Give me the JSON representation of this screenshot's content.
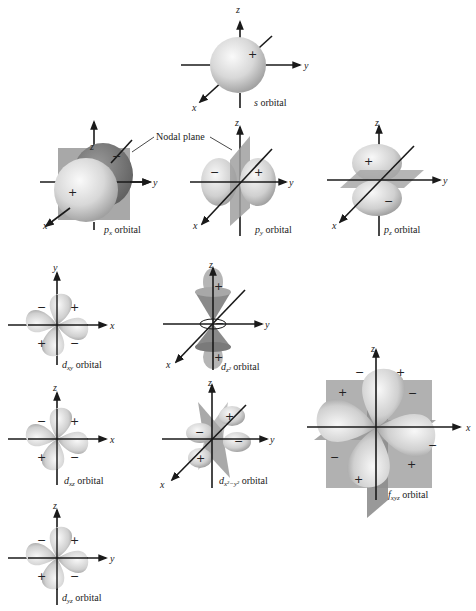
{
  "diagram": {
    "nodal_plane_label": "Nodal plane",
    "orbitals": [
      {
        "id": "s",
        "symbol": "s",
        "subscript": "",
        "suffix": "orbital",
        "axes": [
          "x",
          "y",
          "z"
        ],
        "signs": [
          "+"
        ]
      },
      {
        "id": "px",
        "symbol": "p",
        "subscript": "x",
        "suffix": "orbital",
        "axes": [
          "x",
          "y",
          "z"
        ],
        "signs": [
          "+",
          "−"
        ]
      },
      {
        "id": "py",
        "symbol": "p",
        "subscript": "y",
        "suffix": "orbital",
        "axes": [
          "x",
          "y",
          "z"
        ],
        "signs": [
          "−",
          "+"
        ]
      },
      {
        "id": "pz",
        "symbol": "p",
        "subscript": "z",
        "suffix": "orbital",
        "axes": [
          "x",
          "y",
          "z"
        ],
        "signs": [
          "+",
          "−"
        ]
      },
      {
        "id": "dxy",
        "symbol": "d",
        "subscript": "xy",
        "suffix": "orbital",
        "axes": [
          "x",
          "y"
        ],
        "signs": [
          "−",
          "+",
          "+",
          "−"
        ]
      },
      {
        "id": "dz2",
        "symbol": "d",
        "subscript": "z²",
        "suffix": "orbital",
        "axes": [
          "x",
          "y",
          "z"
        ],
        "signs": [
          "+",
          "−",
          "+"
        ]
      },
      {
        "id": "dxz",
        "symbol": "d",
        "subscript": "xz",
        "suffix": "orbital",
        "axes": [
          "x",
          "z"
        ],
        "signs": [
          "−",
          "+",
          "+",
          "−"
        ]
      },
      {
        "id": "dx2y2",
        "symbol": "d",
        "subscript": "x²−y²",
        "suffix": "orbital",
        "axes": [
          "x",
          "y",
          "z"
        ],
        "signs": [
          "+",
          "−",
          "−",
          "+"
        ]
      },
      {
        "id": "dyz",
        "symbol": "d",
        "subscript": "yz",
        "suffix": "orbital",
        "axes": [
          "y",
          "z"
        ],
        "signs": [
          "−",
          "+",
          "+",
          "−"
        ]
      },
      {
        "id": "fxyz",
        "symbol": "f",
        "subscript": "xyz",
        "suffix": "orbital",
        "axes": [
          "x",
          "z"
        ],
        "signs": [
          "−",
          "+",
          "+",
          "−",
          "−",
          "+",
          "+"
        ]
      }
    ],
    "labels": {
      "s": "s orbital",
      "px": "px orbital",
      "py": "py orbital",
      "pz": "pz orbital",
      "dxy": "dxy orbital",
      "dz2": "dz² orbital",
      "dxz": "dxz orbital",
      "dx2y2": "dx²−y² orbital",
      "dyz": "dyz orbital",
      "fxyz": "fxyz orbital"
    },
    "colors": {
      "lobe_light": "#f2f2f2",
      "lobe_mid": "#bdbdbd",
      "lobe_dark": "#8a8a8a",
      "plane": "#9e9e9e",
      "axis": "#1a1a1a"
    }
  }
}
